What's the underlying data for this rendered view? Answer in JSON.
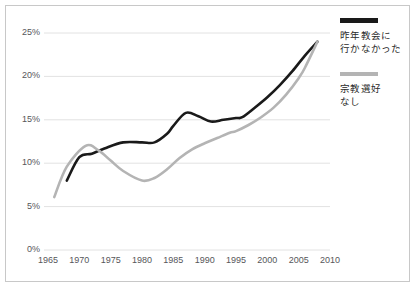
{
  "figure": {
    "background_color": "#ffffff",
    "frame_color": "#c8c8c8"
  },
  "legend": {
    "position": "right",
    "entries": [
      {
        "swatch": "black",
        "color": "#1a1a1a",
        "label": "昨年教会に\n行かなかった"
      },
      {
        "swatch": "grey",
        "color": "#b4b4b4",
        "label": "宗教選好\nなし"
      }
    ]
  },
  "axis": {
    "y_ticks": [
      "0%",
      "5%",
      "10%",
      "15%",
      "20%",
      "25%"
    ],
    "x_ticks": [
      "1965",
      "1970",
      "1975",
      "1980",
      "1985",
      "1990",
      "1995",
      "2000",
      "2005",
      "2010"
    ]
  },
  "chart_data": {
    "type": "line",
    "title": "",
    "subtitle": "",
    "xlabel": "",
    "ylabel": "",
    "xlim": [
      1965,
      2010
    ],
    "ylim": [
      0,
      25
    ],
    "y_unit": "percent",
    "grid": true,
    "gridlines_y": [
      0,
      5,
      10,
      15,
      20,
      25
    ],
    "legend_position": "right",
    "series": [
      {
        "name": "昨年教会に行かなかった",
        "color": "#1a1a1a",
        "width": 2.6,
        "x": [
          1968,
          1970,
          1972,
          1974,
          1977,
          1980,
          1982,
          1984,
          1985,
          1987,
          1989,
          1991,
          1993,
          1995,
          1996,
          1998,
          2000,
          2002,
          2004,
          2006,
          2008
        ],
        "values": [
          8.0,
          10.7,
          11.1,
          11.7,
          12.4,
          12.4,
          12.4,
          13.4,
          14.3,
          15.8,
          15.4,
          14.8,
          15.0,
          15.2,
          15.3,
          16.4,
          17.6,
          19.0,
          20.6,
          22.4,
          24.0
        ]
      },
      {
        "name": "宗教選好なし",
        "color": "#b4b4b4",
        "width": 2.6,
        "x": [
          1966,
          1968,
          1971,
          1973,
          1975,
          1977,
          1980,
          1982,
          1984,
          1986,
          1988,
          1990,
          1992,
          1994,
          1995,
          1997,
          1999,
          2001,
          2003,
          2005,
          2006,
          2008
        ],
        "values": [
          6.1,
          9.6,
          12.0,
          11.5,
          10.3,
          9.1,
          8.0,
          8.3,
          9.3,
          10.6,
          11.6,
          12.3,
          12.9,
          13.5,
          13.7,
          14.4,
          15.3,
          16.4,
          17.9,
          19.8,
          21.0,
          24.0
        ]
      }
    ]
  }
}
